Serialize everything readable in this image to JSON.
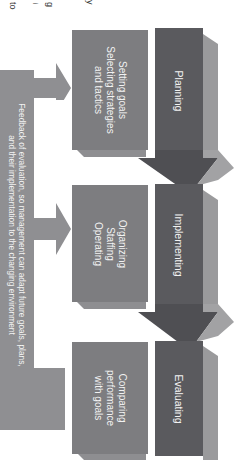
{
  "page_fragment": {
    "chars": [
      "to",
      "i",
      "g",
      "y"
    ]
  },
  "stages": [
    {
      "header": "Planning",
      "activities": [
        "Setting goals",
        "Selecting strategies",
        "and tactics"
      ]
    },
    {
      "header": "Implementing",
      "activities": [
        "Organizing",
        "Staffing",
        "Operating"
      ]
    },
    {
      "header": "Evaluating",
      "activities": [
        "Comparing",
        "performance",
        "with goals"
      ]
    }
  ],
  "feedback": {
    "line1": "Feedback of evaluation, so management can adapt future goals, plans,",
    "line2": "and their implementation to the changing environment"
  },
  "colors": {
    "header": "#5a5a5e",
    "activity_box": "#7d7d80",
    "feedback_bar": "#8f8f92",
    "side_faces": "#a9a9ab",
    "text": "#f2f2f2"
  },
  "orientation": "rotated 90deg clockwise"
}
